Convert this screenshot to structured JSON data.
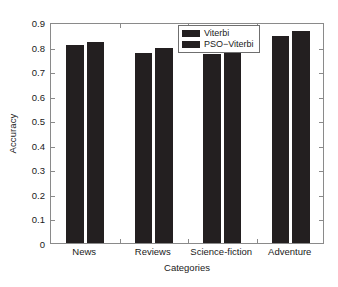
{
  "chart_data": {
    "type": "bar",
    "title": "",
    "subtitle": "",
    "xlabel": "Categories",
    "ylabel": "Accuracy",
    "categories": [
      "News",
      "Reviews",
      "Science-fiction",
      "Adventure"
    ],
    "series": [
      {
        "name": "Viterbi",
        "values": [
          0.805,
          0.775,
          0.77,
          0.845
        ],
        "color": "#231f20"
      },
      {
        "name": "PSO−Viterbi",
        "values": [
          0.82,
          0.793,
          0.8,
          0.865
        ],
        "color": "#231f20"
      }
    ],
    "ylim": [
      0,
      0.9
    ],
    "yticks": [
      0,
      0.1,
      0.2,
      0.3,
      0.4,
      0.5,
      0.6,
      0.7,
      0.8,
      0.9
    ],
    "ytick_labels": [
      "0",
      "0.1",
      "0.2",
      "0.3",
      "0.4",
      "0.5",
      "0.6",
      "0.7",
      "0.8",
      "0.9"
    ],
    "grid": false,
    "legend_position": "top-center",
    "annotations": []
  },
  "axes": {
    "y_title": "Accuracy",
    "x_title": "Categories",
    "frame_color": "#8a8a8a"
  },
  "legend": {
    "entries": [
      {
        "label": "Viterbi"
      },
      {
        "label": "PSO−Viterbi"
      }
    ]
  }
}
